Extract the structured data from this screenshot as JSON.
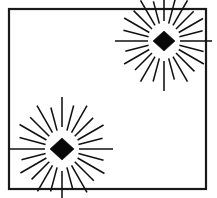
{
  "figure": {
    "canvas": {
      "width": 217,
      "height": 198,
      "background": "#ffffff"
    },
    "frame": {
      "label": "Rectangular border frame",
      "x": 9,
      "y": 9,
      "width": 197,
      "height": 180,
      "stroke_color": "#1a1a1a",
      "stroke_width": 2.2,
      "fill": "#ffffff"
    },
    "ray_style": {
      "color": "#111111",
      "width": 1.55,
      "count_per_burst": 24
    },
    "diamond_color": "#080808",
    "bursts": [
      {
        "name": "upper-right-burst",
        "label": "Upper right starburst",
        "center_x": 164,
        "center_y": 41,
        "diamond_half_width": 11,
        "diamond_half_height": 10,
        "ray_inner_radius": 17,
        "ray_outer_radius": 49,
        "rays": [
          {
            "angle": 0,
            "inner": 20,
            "outer": 49
          },
          {
            "angle": 15,
            "inner": 18,
            "outer": 43
          },
          {
            "angle": 30,
            "inner": 18,
            "outer": 47
          },
          {
            "angle": 45,
            "inner": 17,
            "outer": 42
          },
          {
            "angle": 60,
            "inner": 17,
            "outer": 45
          },
          {
            "angle": 75,
            "inner": 16,
            "outer": 40
          },
          {
            "angle": 90,
            "inner": 16,
            "outer": 48
          },
          {
            "angle": 105,
            "inner": 16,
            "outer": 41
          },
          {
            "angle": 120,
            "inner": 17,
            "outer": 46
          },
          {
            "angle": 135,
            "inner": 17,
            "outer": 43
          },
          {
            "angle": 150,
            "inner": 18,
            "outer": 47
          },
          {
            "angle": 165,
            "inner": 18,
            "outer": 40
          },
          {
            "angle": 180,
            "inner": 20,
            "outer": 50
          },
          {
            "angle": 195,
            "inner": 18,
            "outer": 42
          },
          {
            "angle": 210,
            "inner": 18,
            "outer": 47
          },
          {
            "angle": 225,
            "inner": 17,
            "outer": 41
          },
          {
            "angle": 240,
            "inner": 17,
            "outer": 46
          },
          {
            "angle": 255,
            "inner": 16,
            "outer": 40
          },
          {
            "angle": 270,
            "inner": 16,
            "outer": 49
          },
          {
            "angle": 285,
            "inner": 16,
            "outer": 42
          },
          {
            "angle": 300,
            "inner": 17,
            "outer": 46
          },
          {
            "angle": 315,
            "inner": 17,
            "outer": 43
          },
          {
            "angle": 330,
            "inner": 18,
            "outer": 47
          },
          {
            "angle": 345,
            "inner": 18,
            "outer": 41
          }
        ]
      },
      {
        "name": "lower-left-burst",
        "label": "Lower left starburst",
        "center_x": 62,
        "center_y": 149,
        "diamond_half_width": 12,
        "diamond_half_height": 11,
        "ray_inner_radius": 18,
        "ray_outer_radius": 52,
        "rays": [
          {
            "angle": 0,
            "inner": 22,
            "outer": 52
          },
          {
            "angle": 15,
            "inner": 19,
            "outer": 45
          },
          {
            "angle": 30,
            "inner": 19,
            "outer": 50
          },
          {
            "angle": 45,
            "inner": 18,
            "outer": 44
          },
          {
            "angle": 60,
            "inner": 18,
            "outer": 48
          },
          {
            "angle": 75,
            "inner": 17,
            "outer": 42
          },
          {
            "angle": 90,
            "inner": 17,
            "outer": 51
          },
          {
            "angle": 105,
            "inner": 17,
            "outer": 43
          },
          {
            "angle": 120,
            "inner": 18,
            "outer": 49
          },
          {
            "angle": 135,
            "inner": 18,
            "outer": 45
          },
          {
            "angle": 150,
            "inner": 19,
            "outer": 50
          },
          {
            "angle": 165,
            "inner": 19,
            "outer": 42
          },
          {
            "angle": 180,
            "inner": 22,
            "outer": 51
          },
          {
            "angle": 195,
            "inner": 19,
            "outer": 44
          },
          {
            "angle": 210,
            "inner": 19,
            "outer": 49
          },
          {
            "angle": 225,
            "inner": 18,
            "outer": 43
          },
          {
            "angle": 240,
            "inner": 18,
            "outer": 48
          },
          {
            "angle": 255,
            "inner": 17,
            "outer": 42
          },
          {
            "angle": 270,
            "inner": 17,
            "outer": 52
          },
          {
            "angle": 285,
            "inner": 17,
            "outer": 44
          },
          {
            "angle": 300,
            "inner": 18,
            "outer": 49
          },
          {
            "angle": 315,
            "inner": 18,
            "outer": 45
          },
          {
            "angle": 330,
            "inner": 19,
            "outer": 50
          },
          {
            "angle": 345,
            "inner": 19,
            "outer": 43
          }
        ]
      }
    ]
  }
}
